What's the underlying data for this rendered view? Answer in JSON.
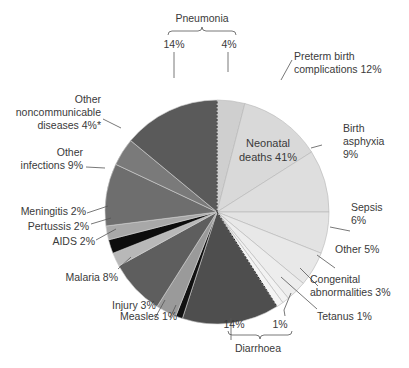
{
  "chart_data": {
    "type": "pie",
    "title": "",
    "center_label": [
      "Neonatal",
      "deaths 41%"
    ],
    "total_percent": 100,
    "slices": [
      {
        "name": "Pneumonia (neonatal)",
        "value": 4,
        "group": "neonatal",
        "color": "#cfcfcf"
      },
      {
        "name": "Preterm birth complications",
        "value": 12,
        "group": "neonatal",
        "color": "#d9d9d9"
      },
      {
        "name": "Birth asphyxia",
        "value": 9,
        "group": "neonatal",
        "color": "#dedede"
      },
      {
        "name": "Sepsis",
        "value": 6,
        "group": "neonatal",
        "color": "#e3e3e3"
      },
      {
        "name": "Other (neonatal)",
        "value": 5,
        "group": "neonatal",
        "color": "#e8e8e8"
      },
      {
        "name": "Congenital abnormalities",
        "value": 3,
        "group": "neonatal",
        "color": "#ededed"
      },
      {
        "name": "Tetanus",
        "value": 1,
        "group": "neonatal",
        "color": "#f2f2f2"
      },
      {
        "name": "Diarrhoea (neonatal)",
        "value": 1,
        "group": "neonatal",
        "color": "#f4f4f4"
      },
      {
        "name": "Diarrhoea (post-neonatal)",
        "value": 14,
        "group": "postneonatal",
        "color": "#4e4e4e"
      },
      {
        "name": "Measles",
        "value": 1,
        "group": "postneonatal",
        "color": "#111111"
      },
      {
        "name": "Injury",
        "value": 3,
        "group": "postneonatal",
        "color": "#9a9a9a"
      },
      {
        "name": "Malaria",
        "value": 8,
        "group": "postneonatal",
        "color": "#5e5e5e"
      },
      {
        "name": "AIDS",
        "value": 2,
        "group": "postneonatal",
        "color": "#b8b8b8"
      },
      {
        "name": "Pertussis",
        "value": 2,
        "group": "postneonatal",
        "color": "#0d0d0d"
      },
      {
        "name": "Meningitis",
        "value": 2,
        "group": "postneonatal",
        "color": "#a8a8a8"
      },
      {
        "name": "Other infections",
        "value": 9,
        "group": "postneonatal",
        "color": "#6e6e6e"
      },
      {
        "name": "Other noncommunicable diseases",
        "value": 4,
        "group": "postneonatal",
        "color": "#7a7a7a",
        "note": "*"
      },
      {
        "name": "Pneumonia (post-neonatal)",
        "value": 14,
        "group": "postneonatal",
        "color": "#5a5a5a"
      }
    ],
    "group_brackets": [
      {
        "label": "Pneumonia",
        "parts": [
          "14%",
          "4%"
        ]
      },
      {
        "label": "Diarrhoea",
        "parts": [
          "14%",
          "1%"
        ]
      }
    ]
  },
  "labels": {
    "pneumonia": "Pneumonia",
    "pneumonia_14": "14%",
    "pneumonia_4": "4%",
    "preterm_1": "Preterm birth",
    "preterm_2": "complications 12%",
    "birth_1": "Birth",
    "birth_2": "asphyxia",
    "birth_3": "9%",
    "sepsis_1": "Sepsis",
    "sepsis_2": "6%",
    "other5": "Other 5%",
    "congenital_1": "Congenital",
    "congenital_2": "abnormalities 3%",
    "tetanus": "Tetanus 1%",
    "diarrhoea": "Diarrhoea",
    "diarrhoea_14": "14%",
    "diarrhoea_1": "1%",
    "measles": "Measles 1%",
    "injury": "Injury 3%",
    "malaria": "Malaria 8%",
    "aids": "AIDS 2%",
    "pertussis": "Pertussis 2%",
    "meningitis": "Meningitis 2%",
    "otherinf_1": "Other",
    "otherinf_2": "infections 9%",
    "ncd_1": "Other",
    "ncd_2": "noncommunicable",
    "ncd_3": "diseases 4%*",
    "center_1": "Neonatal",
    "center_2": "deaths 41%"
  }
}
